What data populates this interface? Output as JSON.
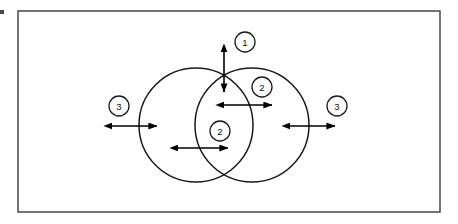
{
  "figure": {
    "background_color": "#ffffff",
    "frame": {
      "stroke_color": "#3a3a3a",
      "x": 18,
      "y": 11,
      "width": 422,
      "height": 201
    },
    "circles": [
      {
        "name": "left-circle",
        "cx": 196,
        "cy": 125,
        "r": 57,
        "stroke_color": "#1a1a1a"
      },
      {
        "name": "right-circle",
        "cx": 252,
        "cy": 125,
        "r": 57,
        "stroke_color": "#1a1a1a"
      }
    ],
    "callouts": [
      {
        "id": "callout-1",
        "label": "1",
        "cx": 245,
        "cy": 42,
        "r": 10,
        "arrow": {
          "orientation": "vertical",
          "x1": 224,
          "y1": 52,
          "x2": 224,
          "y2": 92
        }
      },
      {
        "id": "callout-2-upper",
        "label": "2",
        "cx": 262,
        "cy": 87,
        "r": 10,
        "arrow": {
          "orientation": "horizontal",
          "x1": 224,
          "y1": 105,
          "x2": 272,
          "y2": 105
        }
      },
      {
        "id": "callout-2-lower",
        "label": "2",
        "cx": 220,
        "cy": 131,
        "r": 10,
        "arrow": {
          "orientation": "horizontal",
          "x1": 178,
          "y1": 148,
          "x2": 228,
          "y2": 148
        }
      },
      {
        "id": "callout-3-left",
        "label": "3",
        "cx": 119,
        "cy": 106,
        "r": 10,
        "arrow": {
          "orientation": "horizontal",
          "x1": 112,
          "y1": 126,
          "x2": 157,
          "y2": 126
        }
      },
      {
        "id": "callout-3-right",
        "label": "3",
        "cx": 337,
        "cy": 106,
        "r": 10,
        "arrow": {
          "orientation": "horizontal",
          "x1": 290,
          "y1": 126,
          "x2": 335,
          "y2": 126
        }
      }
    ],
    "artifact": {
      "name": "left-edge-speck",
      "x": 0,
      "y": 10,
      "width": 4,
      "height": 4
    }
  }
}
